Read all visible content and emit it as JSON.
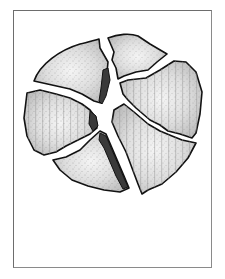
{
  "figure": {
    "fragment_count": 6,
    "colors": {
      "frame": "#6d6d6d",
      "outline": "#111111",
      "fragment_fill_light": "#f2f2f2",
      "fragment_fill_mid": "#c9c9c9",
      "stipple": "#555555",
      "crack_fill": "#3a3a3a",
      "background": "#ffffff"
    }
  }
}
